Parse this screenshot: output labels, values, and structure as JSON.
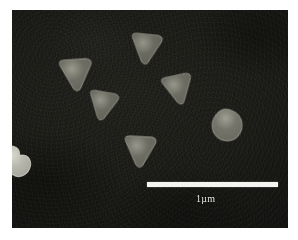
{
  "figure": {
    "type": "sem-micrograph",
    "caption": "",
    "background_color": "#ffffff",
    "frame": {
      "x": 12,
      "y": 10,
      "width": 276,
      "height": 218,
      "substrate_color": "#1d1d19",
      "border_color": "#101010"
    }
  },
  "scale_bar": {
    "label": "1µm",
    "x": 147,
    "y": 182,
    "length_px": 131,
    "thickness_px": 5,
    "color": "#f4f4f2",
    "label_x": 196,
    "label_y": 194,
    "label_color": "#e8e8e4"
  },
  "particles": [
    {
      "id": "particle-1",
      "name": "triangle-upper-left",
      "shape": "rounded-triangle",
      "orientation": "point-down",
      "x": 57,
      "y": 57,
      "size": 40,
      "rotation": -4,
      "fill": "#6e6e64",
      "edge": "#9a9a8e"
    },
    {
      "id": "particle-2",
      "name": "triangle-top-center",
      "shape": "rounded-triangle",
      "orientation": "point-down",
      "x": 126,
      "y": 33,
      "size": 38,
      "rotation": 6,
      "fill": "#6a6a60",
      "edge": "#95958a"
    },
    {
      "id": "particle-3",
      "name": "triangle-mid-left",
      "shape": "rounded-triangle",
      "orientation": "point-down",
      "x": 83,
      "y": 91,
      "size": 36,
      "rotation": 10,
      "fill": "#6b6b61",
      "edge": "#96968b"
    },
    {
      "id": "particle-4",
      "name": "triangle-mid-right",
      "shape": "rounded-triangle",
      "orientation": "point-down",
      "x": 162,
      "y": 72,
      "size": 37,
      "rotation": -12,
      "fill": "#6c6c62",
      "edge": "#97978c"
    },
    {
      "id": "particle-5",
      "name": "triangle-bottom-center",
      "shape": "rounded-triangle",
      "orientation": "point-down",
      "x": 120,
      "y": 135,
      "size": 39,
      "rotation": 3,
      "fill": "#6d6d63",
      "edge": "#98988d"
    },
    {
      "id": "particle-6",
      "name": "rounded-particle-right",
      "shape": "rounded-blob",
      "orientation": "point-down",
      "x": 208,
      "y": 110,
      "size": 33,
      "rotation": 18,
      "fill": "#74746a",
      "edge": "#a0a095"
    },
    {
      "id": "particle-7",
      "name": "bright-cluster-left-edge",
      "shape": "irregular-cluster",
      "orientation": "none",
      "x": 2,
      "y": 143,
      "size": 30,
      "rotation": 0,
      "fill": "#b9b9ae",
      "edge": "#d8d8cd"
    }
  ],
  "annotations": {
    "particle_count": 7,
    "triangle_count": 5
  }
}
